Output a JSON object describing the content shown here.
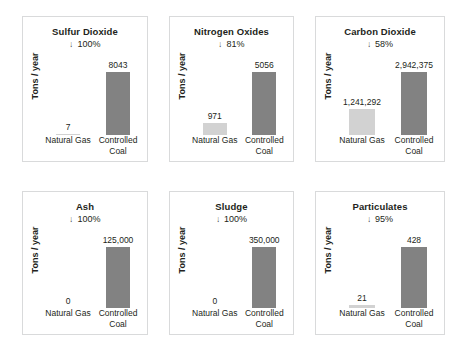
{
  "chart_data": {
    "type": "bar",
    "ylabel": "Tons / year",
    "categories": [
      "Natural Gas",
      "Controlled Coal"
    ],
    "grid": false,
    "legend": "none",
    "panels": [
      {
        "title": "Sulfur Dioxide",
        "reduction_arrow": "↓",
        "reduction": "100%",
        "ylabel": "Tons / year",
        "categories": [
          "Natural Gas",
          "Controlled Coal"
        ],
        "values": [
          7,
          8043
        ],
        "value_labels": [
          "7",
          "8043"
        ],
        "ylim": [
          0,
          8043
        ],
        "bar_colors": [
          "#d2d2d2",
          "#828282"
        ]
      },
      {
        "title": "Nitrogen Oxides",
        "reduction_arrow": "↓",
        "reduction": "81%",
        "ylabel": "Tons / year",
        "categories": [
          "Natural Gas",
          "Controlled Coal"
        ],
        "values": [
          971,
          5056
        ],
        "value_labels": [
          "971",
          "5056"
        ],
        "ylim": [
          0,
          5056
        ],
        "bar_colors": [
          "#d2d2d2",
          "#828282"
        ]
      },
      {
        "title": "Carbon Dioxide",
        "reduction_arrow": "↓",
        "reduction": "58%",
        "ylabel": "Tons / year",
        "categories": [
          "Natural Gas",
          "Controlled Coal"
        ],
        "values": [
          1241292,
          2942375
        ],
        "value_labels": [
          "1,241,292",
          "2,942,375"
        ],
        "ylim": [
          0,
          2942375
        ],
        "bar_colors": [
          "#d2d2d2",
          "#828282"
        ]
      },
      {
        "title": "Ash",
        "reduction_arrow": "↓",
        "reduction": "100%",
        "ylabel": "Tons / year",
        "categories": [
          "Natural Gas",
          "Controlled Coal"
        ],
        "values": [
          0,
          125000
        ],
        "value_labels": [
          "0",
          "125,000"
        ],
        "ylim": [
          0,
          125000
        ],
        "bar_colors": [
          "#d2d2d2",
          "#828282"
        ]
      },
      {
        "title": "Sludge",
        "reduction_arrow": "↓",
        "reduction": "100%",
        "ylabel": "Tons / year",
        "categories": [
          "Natural Gas",
          "Controlled Coal"
        ],
        "values": [
          0,
          350000
        ],
        "value_labels": [
          "0",
          "350,000"
        ],
        "ylim": [
          0,
          350000
        ],
        "bar_colors": [
          "#d2d2d2",
          "#828282"
        ]
      },
      {
        "title": "Particulates",
        "reduction_arrow": "↓",
        "reduction": "95%",
        "ylabel": "Tons / year",
        "categories": [
          "Natural Gas",
          "Controlled Coal"
        ],
        "values": [
          21,
          428
        ],
        "value_labels": [
          "21",
          "428"
        ],
        "ylim": [
          0,
          428
        ],
        "bar_colors": [
          "#d2d2d2",
          "#828282"
        ]
      }
    ]
  }
}
